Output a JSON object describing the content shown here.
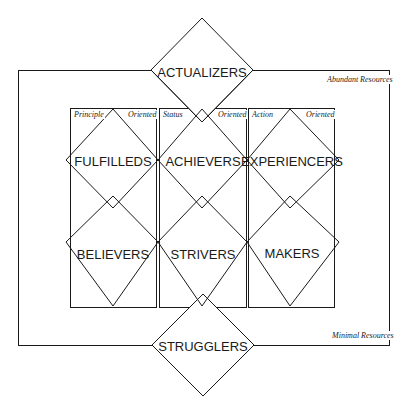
{
  "diagram": {
    "axis_labels": {
      "top": "Abundant Resources",
      "bottom": "Minimal Resources"
    },
    "columns": [
      {
        "left_label": "Principle",
        "right_label": "Oriented"
      },
      {
        "left_label": "Status",
        "right_label": "Oriented"
      },
      {
        "left_label": "Action",
        "right_label": "Oriented"
      }
    ],
    "segments": {
      "top": "ACTUALIZERS",
      "row1": [
        "FULFILLEDS",
        "ACHIEVERS",
        "EXPERIENCERS"
      ],
      "row2": [
        "BELIEVERS",
        "STRIVERS",
        "MAKERS"
      ],
      "bottom": "STRUGGLERS"
    },
    "colors": {
      "line": "#1a1a1a",
      "background": "#ffffff"
    }
  }
}
